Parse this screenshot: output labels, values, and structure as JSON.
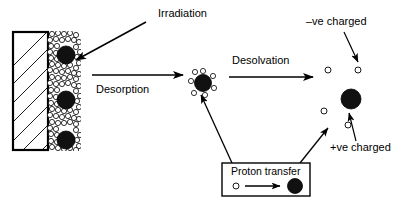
{
  "diagram": {
    "labels": {
      "irradiation": "Irradiation",
      "desorption": "Desorption",
      "desolvation": "Desolvation",
      "negative_charge": "–ve charged",
      "positive_charge": "+ve charged",
      "proton_transfer": "Proton transfer"
    },
    "colors": {
      "stroke": "#000000",
      "analyte_fill": "#111111",
      "matrix_fill": "#ffffff",
      "background": "#ffffff"
    },
    "substrate": {
      "name": "hatched sample plate",
      "x": 13,
      "y": 32,
      "width": 35,
      "height": 118,
      "hatch_count": 7
    },
    "matrix_layer": {
      "name": "matrix crystal layer",
      "x": 48,
      "y": 32,
      "width": 32,
      "height": 118,
      "particle_radius": 2.6
    },
    "embedded_analytes": [
      {
        "cx": 66,
        "cy": 55,
        "r": 9
      },
      {
        "cx": 66,
        "cy": 100,
        "r": 9
      },
      {
        "cx": 66,
        "cy": 140,
        "r": 9
      }
    ],
    "cluster": {
      "name": "desorbed matrix-analyte cluster",
      "cx": 203,
      "cy": 83,
      "r": 8.5,
      "satellite_radius": 2.6,
      "satellite_count": 7
    },
    "free_ions": [
      {
        "type": "matrix-ion",
        "charge": "negative",
        "cx": 328,
        "cy": 70,
        "r": 3.0
      },
      {
        "type": "matrix-ion",
        "charge": "negative",
        "cx": 358,
        "cy": 70,
        "r": 3.0
      },
      {
        "type": "matrix-ion",
        "charge": "negative",
        "cx": 324,
        "cy": 111,
        "r": 3.0
      },
      {
        "type": "matrix-ion",
        "charge": "negative",
        "cx": 348,
        "cy": 125,
        "r": 3.0
      },
      {
        "type": "analyte-ion",
        "charge": "positive",
        "cx": 351,
        "cy": 99,
        "r": 10
      }
    ],
    "legend_box": {
      "x": 222,
      "y": 163,
      "width": 88,
      "height": 33,
      "small_circle": {
        "cx": 236,
        "cy": 186,
        "r": 3.0
      },
      "large_circle": {
        "cx": 295,
        "cy": 186,
        "r": 7.5
      },
      "arrow": {
        "x1": 246,
        "y1": 186,
        "x2": 282,
        "y2": 186
      }
    },
    "arrows": [
      {
        "name": "irradiation-arrow",
        "x1": 146,
        "y1": 22,
        "x2": 73,
        "y2": 62
      },
      {
        "name": "desorption-arrow",
        "x1": 92,
        "y1": 75,
        "x2": 186,
        "y2": 75
      },
      {
        "name": "desolvation-arrow",
        "x1": 229,
        "y1": 77,
        "x2": 316,
        "y2": 77
      },
      {
        "name": "negative-label-arrow",
        "x1": 344,
        "y1": 32,
        "x2": 358,
        "y2": 62
      },
      {
        "name": "positive-label-arrow",
        "x1": 355,
        "y1": 140,
        "x2": 348,
        "y2": 112
      },
      {
        "name": "proton-transfer-to-cluster-arrow",
        "x1": 232,
        "y1": 163,
        "x2": 201,
        "y2": 93
      },
      {
        "name": "proton-transfer-to-ions-arrow",
        "x1": 300,
        "y1": 163,
        "x2": 327,
        "y2": 128
      }
    ]
  }
}
